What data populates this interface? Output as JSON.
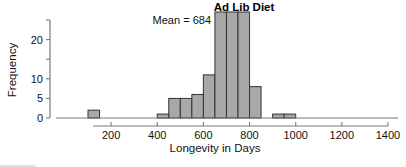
{
  "chart_data": {
    "type": "bar",
    "title": "Ad Lib Diet",
    "xlabel": "Longevity in Days",
    "ylabel": "Frequency",
    "xlim": [
      100,
      1400
    ],
    "ylim": [
      0,
      25
    ],
    "grid": false,
    "legend": null,
    "bin_width": 50,
    "xticks": [
      200,
      400,
      600,
      800,
      1000,
      1200,
      1400
    ],
    "xtick_labels": [
      "200",
      "400",
      "600",
      "800",
      "1000",
      "1200",
      "1400"
    ],
    "yticks": [
      0,
      5,
      10,
      15,
      20,
      25
    ],
    "ytick_labels": [
      "0",
      "5",
      "10",
      "",
      "20",
      ""
    ],
    "annotations": [
      {
        "text": "Mean = 684",
        "x": 600,
        "y": 24
      }
    ],
    "bars": [
      {
        "x0": 100,
        "x1": 150,
        "value": 2
      },
      {
        "x0": 400,
        "x1": 450,
        "value": 1
      },
      {
        "x0": 450,
        "x1": 500,
        "value": 5
      },
      {
        "x0": 500,
        "x1": 550,
        "value": 5
      },
      {
        "x0": 550,
        "x1": 600,
        "value": 6
      },
      {
        "x0": 600,
        "x1": 650,
        "value": 11
      },
      {
        "x0": 650,
        "x1": 700,
        "value": 25
      },
      {
        "x0": 700,
        "x1": 750,
        "value": 25
      },
      {
        "x0": 750,
        "x1": 800,
        "value": 25
      },
      {
        "x0": 800,
        "x1": 850,
        "value": 8
      },
      {
        "x0": 900,
        "x1": 950,
        "value": 1
      },
      {
        "x0": 950,
        "x1": 1000,
        "value": 1
      }
    ],
    "categories": [
      "100-150",
      "400-450",
      "450-500",
      "500-550",
      "550-600",
      "600-650",
      "650-700",
      "700-750",
      "750-800",
      "800-850",
      "900-950",
      "950-1000"
    ],
    "values": [
      2,
      1,
      5,
      5,
      6,
      11,
      25,
      25,
      25,
      8,
      1,
      1
    ],
    "colors": {
      "bar_fill": "#a8a8a8",
      "bar_stroke": "#333333",
      "axis": "#7a7a7a",
      "text": "#111111"
    }
  }
}
